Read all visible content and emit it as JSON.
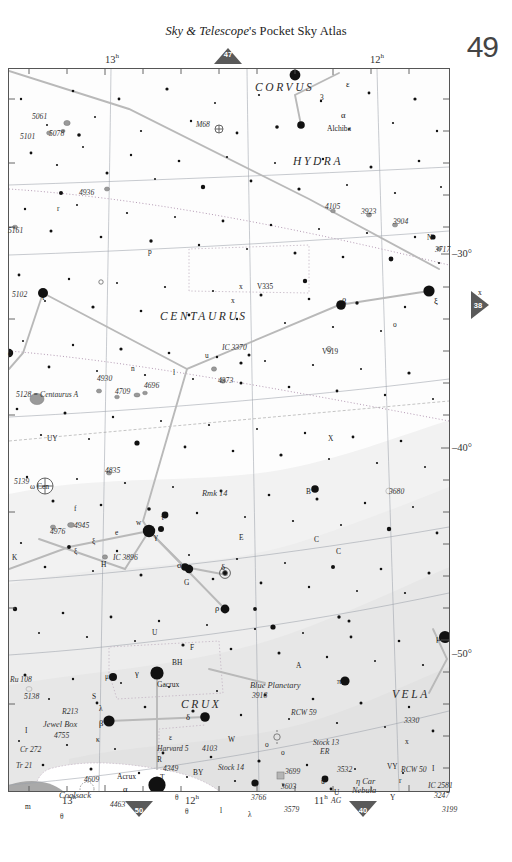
{
  "header": {
    "title_italic": "Sky & Telescope",
    "title_rest": "'s Pocket Sky Atlas",
    "page_number": "49"
  },
  "markers": {
    "top": "47",
    "right": "38",
    "bottom_left": "50",
    "bottom_right": "40"
  },
  "axes": {
    "ra_top": [
      {
        "label": "13",
        "unit": "h",
        "x": 113
      },
      {
        "label": "12",
        "unit": "h",
        "x": 378
      }
    ],
    "ra_bottom": [
      {
        "label": "13",
        "unit": "h",
        "x": 70
      },
      {
        "label": "12",
        "unit": "h",
        "x": 193
      },
      {
        "label": "11",
        "unit": "h",
        "x": 322
      }
    ],
    "dec_right": [
      {
        "label": "–30°",
        "y": 253
      },
      {
        "label": "–40°",
        "y": 447
      },
      {
        "label": "–50°",
        "y": 653
      }
    ]
  },
  "constellations": [
    {
      "name": "CORVUS",
      "x": 255,
      "y": 81
    },
    {
      "name": "HYDRA",
      "x": 293,
      "y": 155
    },
    {
      "name": "CENTAURUS",
      "x": 160,
      "y": 310
    },
    {
      "name": "CRUX",
      "x": 181,
      "y": 698
    },
    {
      "name": "VELA",
      "x": 392,
      "y": 688
    }
  ],
  "deep_sky": [
    {
      "name": "5061",
      "x": 32,
      "y": 112,
      "cls": "dso"
    },
    {
      "name": "5101",
      "x": 20,
      "y": 132,
      "cls": "dso"
    },
    {
      "name": "5078",
      "x": 49,
      "y": 129,
      "cls": "dso"
    },
    {
      "name": "M68",
      "x": 196,
      "y": 120,
      "cls": "dso"
    },
    {
      "name": "4936",
      "x": 79,
      "y": 188,
      "cls": "dso"
    },
    {
      "name": "5161",
      "x": 8,
      "y": 226,
      "cls": "dso"
    },
    {
      "name": "4105",
      "x": 325,
      "y": 202,
      "cls": "dso"
    },
    {
      "name": "3923",
      "x": 361,
      "y": 207,
      "cls": "dso"
    },
    {
      "name": "3904",
      "x": 393,
      "y": 217,
      "cls": "dso"
    },
    {
      "name": "3717",
      "x": 435,
      "y": 245,
      "cls": "dso"
    },
    {
      "name": "5102",
      "x": 12,
      "y": 290,
      "cls": "dso"
    },
    {
      "name": "IC 3370",
      "x": 222,
      "y": 343,
      "cls": "dso"
    },
    {
      "name": "4373",
      "x": 218,
      "y": 376,
      "cls": "dso"
    },
    {
      "name": "4930",
      "x": 97,
      "y": 374,
      "cls": "dso"
    },
    {
      "name": "4709",
      "x": 115,
      "y": 387,
      "cls": "dso"
    },
    {
      "name": "4696",
      "x": 144,
      "y": 381,
      "cls": "dso"
    },
    {
      "name": "5128 = Centaurus A",
      "x": 16,
      "y": 390,
      "cls": "dso"
    },
    {
      "name": "4835",
      "x": 105,
      "y": 466,
      "cls": "dso"
    },
    {
      "name": "5139",
      "x": 14,
      "y": 477,
      "cls": "dso"
    },
    {
      "name": "Rmk 14",
      "x": 202,
      "y": 489,
      "cls": "dso-big"
    },
    {
      "name": "3680",
      "x": 389,
      "y": 487,
      "cls": "dso"
    },
    {
      "name": "4976",
      "x": 50,
      "y": 527,
      "cls": "dso"
    },
    {
      "name": "4945",
      "x": 74,
      "y": 521,
      "cls": "dso"
    },
    {
      "name": "IC 3896",
      "x": 113,
      "y": 553,
      "cls": "dso"
    },
    {
      "name": "Ru 108",
      "x": 10,
      "y": 675,
      "cls": "dso"
    },
    {
      "name": "5138",
      "x": 24,
      "y": 692,
      "cls": "dso"
    },
    {
      "name": "R213",
      "x": 62,
      "y": 707,
      "cls": "dso"
    },
    {
      "name": "Jewel Box",
      "x": 43,
      "y": 720,
      "cls": "dso-big"
    },
    {
      "name": "4755",
      "x": 54,
      "y": 731,
      "cls": "dso"
    },
    {
      "name": "Cr 272",
      "x": 20,
      "y": 745,
      "cls": "dso"
    },
    {
      "name": "Tr 21",
      "x": 16,
      "y": 761,
      "cls": "dso"
    },
    {
      "name": "4609",
      "x": 84,
      "y": 775,
      "cls": "dso"
    },
    {
      "name": "4463",
      "x": 110,
      "y": 800,
      "cls": "dso"
    },
    {
      "name": "Harvard 5",
      "x": 157,
      "y": 744,
      "cls": "dso"
    },
    {
      "name": "4103",
      "x": 202,
      "y": 744,
      "cls": "dso"
    },
    {
      "name": "4349",
      "x": 163,
      "y": 764,
      "cls": "dso"
    },
    {
      "name": "Stock 14",
      "x": 218,
      "y": 763,
      "cls": "dso"
    },
    {
      "name": "3766",
      "x": 251,
      "y": 793,
      "cls": "dso"
    },
    {
      "name": "Blue Planetary",
      "x": 250,
      "y": 681,
      "cls": "dso-big"
    },
    {
      "name": "3918",
      "x": 252,
      "y": 691,
      "cls": "dso"
    },
    {
      "name": "RCW 59",
      "x": 291,
      "y": 708,
      "cls": "dso"
    },
    {
      "name": "Stock 13",
      "x": 313,
      "y": 738,
      "cls": "dso"
    },
    {
      "name": "ER",
      "x": 320,
      "y": 747,
      "cls": "dso"
    },
    {
      "name": "3532",
      "x": 337,
      "y": 765,
      "cls": "dso"
    },
    {
      "name": "3699",
      "x": 285,
      "y": 767,
      "cls": "dso"
    },
    {
      "name": "3603",
      "x": 281,
      "y": 782,
      "cls": "dso"
    },
    {
      "name": "3579",
      "x": 284,
      "y": 805,
      "cls": "dso"
    },
    {
      "name": "3330",
      "x": 404,
      "y": 716,
      "cls": "dso"
    },
    {
      "name": "RCW 50",
      "x": 401,
      "y": 765,
      "cls": "dso"
    },
    {
      "name": "IC 2581",
      "x": 428,
      "y": 781,
      "cls": "dso"
    },
    {
      "name": "3247",
      "x": 434,
      "y": 791,
      "cls": "dso"
    },
    {
      "name": "3199",
      "x": 442,
      "y": 805,
      "cls": "dso"
    },
    {
      "name": "η Car",
      "x": 356,
      "y": 777,
      "cls": "dso-big"
    },
    {
      "name": "Nebula",
      "x": 352,
      "y": 786,
      "cls": "dso-big"
    },
    {
      "name": "AG",
      "x": 331,
      "y": 796,
      "cls": "dso"
    },
    {
      "name": "Coalsack",
      "x": 59,
      "y": 790,
      "cls": "dark-neb"
    }
  ],
  "star_names": [
    {
      "name": "Alchiba",
      "x": 327,
      "y": 124
    },
    {
      "name": "ω Cen",
      "x": 30,
      "y": 482
    },
    {
      "name": "Gacrux",
      "x": 157,
      "y": 680
    },
    {
      "name": "Acrux",
      "x": 117,
      "y": 772
    }
  ],
  "bayer_labels": [
    {
      "t": "ε",
      "x": 346,
      "y": 79,
      "cls": "greek"
    },
    {
      "t": "3",
      "x": 320,
      "y": 93,
      "cls": "bayer"
    },
    {
      "t": "α",
      "x": 341,
      "y": 110,
      "cls": "greek"
    },
    {
      "t": "r",
      "x": 57,
      "y": 204,
      "cls": "bayer"
    },
    {
      "t": "p",
      "x": 148,
      "y": 247,
      "cls": "bayer"
    },
    {
      "t": "N",
      "x": 427,
      "y": 233,
      "cls": "bayer"
    },
    {
      "t": "x",
      "x": 478,
      "y": 288,
      "cls": "bayer"
    },
    {
      "t": "x",
      "x": 239,
      "y": 282,
      "cls": "bayer"
    },
    {
      "t": "x",
      "x": 231,
      "y": 296,
      "cls": "bayer"
    },
    {
      "t": "V335",
      "x": 257,
      "y": 283,
      "cls": "varname"
    },
    {
      "t": "β",
      "x": 342,
      "y": 296,
      "cls": "greek"
    },
    {
      "t": "ξ",
      "x": 434,
      "y": 296,
      "cls": "greek"
    },
    {
      "t": "ι",
      "x": 42,
      "y": 292,
      "cls": "greek"
    },
    {
      "t": "d",
      "x": 8,
      "y": 349,
      "cls": "bayer"
    },
    {
      "t": "o",
      "x": 393,
      "y": 320,
      "cls": "bayer"
    },
    {
      "t": "V919",
      "x": 322,
      "y": 348,
      "cls": "varname"
    },
    {
      "t": "u",
      "x": 205,
      "y": 351,
      "cls": "bayer"
    },
    {
      "t": "n",
      "x": 131,
      "y": 364,
      "cls": "bayer"
    },
    {
      "t": "l",
      "x": 173,
      "y": 368,
      "cls": "bayer"
    },
    {
      "t": "UY",
      "x": 47,
      "y": 434,
      "cls": "bayer"
    },
    {
      "t": "X",
      "x": 328,
      "y": 434,
      "cls": "bayer"
    },
    {
      "t": "B",
      "x": 306,
      "y": 487,
      "cls": "bayer"
    },
    {
      "t": "f",
      "x": 74,
      "y": 504,
      "cls": "bayer"
    },
    {
      "t": "w",
      "x": 136,
      "y": 518,
      "cls": "bayer"
    },
    {
      "t": "τ",
      "x": 161,
      "y": 513,
      "cls": "bayer"
    },
    {
      "t": "γ",
      "x": 154,
      "y": 531,
      "cls": "greek"
    },
    {
      "t": "e",
      "x": 115,
      "y": 528,
      "cls": "bayer"
    },
    {
      "t": "ξ",
      "x": 92,
      "y": 537,
      "cls": "bayer"
    },
    {
      "t": "ξ",
      "x": 74,
      "y": 547,
      "cls": "bayer"
    },
    {
      "t": "E",
      "x": 239,
      "y": 533,
      "cls": "bayer"
    },
    {
      "t": "C",
      "x": 314,
      "y": 535,
      "cls": "bayer"
    },
    {
      "t": "C",
      "x": 336,
      "y": 547,
      "cls": "bayer"
    },
    {
      "t": "K",
      "x": 12,
      "y": 553,
      "cls": "bayer"
    },
    {
      "t": "H",
      "x": 101,
      "y": 560,
      "cls": "bayer"
    },
    {
      "t": "σ",
      "x": 177,
      "y": 560,
      "cls": "greek"
    },
    {
      "t": "δ",
      "x": 221,
      "y": 562,
      "cls": "greek"
    },
    {
      "t": "G",
      "x": 184,
      "y": 578,
      "cls": "bayer"
    },
    {
      "t": "ρ",
      "x": 215,
      "y": 603,
      "cls": "greek"
    },
    {
      "t": "U",
      "x": 152,
      "y": 628,
      "cls": "bayer"
    },
    {
      "t": "F",
      "x": 190,
      "y": 643,
      "cls": "bayer"
    },
    {
      "t": "BH",
      "x": 172,
      "y": 658,
      "cls": "bayer"
    },
    {
      "t": "A",
      "x": 296,
      "y": 661,
      "cls": "bayer"
    },
    {
      "t": "μ",
      "x": 436,
      "y": 633,
      "cls": "greek"
    },
    {
      "t": "π",
      "x": 337,
      "y": 676,
      "cls": "greek"
    },
    {
      "t": "μ",
      "x": 105,
      "y": 672,
      "cls": "bayer"
    },
    {
      "t": "S",
      "x": 92,
      "y": 692,
      "cls": "bayer"
    },
    {
      "t": "λ",
      "x": 99,
      "y": 704,
      "cls": "bayer"
    },
    {
      "t": "β",
      "x": 99,
      "y": 718,
      "cls": "greek"
    },
    {
      "t": "δ",
      "x": 186,
      "y": 712,
      "cls": "greek"
    },
    {
      "t": "γ",
      "x": 135,
      "y": 668,
      "cls": "greek"
    },
    {
      "t": "κ",
      "x": 96,
      "y": 735,
      "cls": "bayer"
    },
    {
      "t": "I",
      "x": 25,
      "y": 726,
      "cls": "bayer"
    },
    {
      "t": "ε",
      "x": 169,
      "y": 733,
      "cls": "bayer"
    },
    {
      "t": "R",
      "x": 157,
      "y": 755,
      "cls": "bayer"
    },
    {
      "t": "T",
      "x": 160,
      "y": 773,
      "cls": "bayer"
    },
    {
      "t": "BY",
      "x": 193,
      "y": 768,
      "cls": "bayer"
    },
    {
      "t": "W",
      "x": 228,
      "y": 735,
      "cls": "bayer"
    },
    {
      "t": "α",
      "x": 123,
      "y": 784,
      "cls": "greek"
    },
    {
      "t": "θ",
      "x": 175,
      "y": 793,
      "cls": "bayer"
    },
    {
      "t": "θ",
      "x": 185,
      "y": 807,
      "cls": "bayer"
    },
    {
      "t": "θ",
      "x": 60,
      "y": 812,
      "cls": "bayer"
    },
    {
      "t": "m",
      "x": 25,
      "y": 802,
      "cls": "bayer"
    },
    {
      "t": "λ",
      "x": 248,
      "y": 810,
      "cls": "bayer"
    },
    {
      "t": "o",
      "x": 265,
      "y": 740,
      "cls": "bayer"
    },
    {
      "t": "o",
      "x": 281,
      "y": 748,
      "cls": "bayer"
    },
    {
      "t": "u",
      "x": 321,
      "y": 777,
      "cls": "bayer"
    },
    {
      "t": "U",
      "x": 334,
      "y": 788,
      "cls": "bayer"
    },
    {
      "t": "VY",
      "x": 387,
      "y": 762,
      "cls": "bayer"
    },
    {
      "t": "r",
      "x": 399,
      "y": 776,
      "cls": "bayer"
    },
    {
      "t": "Y",
      "x": 390,
      "y": 793,
      "cls": "bayer"
    },
    {
      "t": "x",
      "x": 405,
      "y": 737,
      "cls": "bayer"
    },
    {
      "t": "I",
      "x": 432,
      "y": 764,
      "cls": "bayer"
    },
    {
      "t": "l",
      "x": 220,
      "y": 806,
      "cls": "bayer"
    }
  ],
  "colors": {
    "ink": "#1a1a1a",
    "frame": "#555555",
    "grid": "#9aa0a8",
    "ecliptic": "#b08fb0",
    "milkyway": "#efefef",
    "nebula_gray": "#a8a8a8",
    "marker_fill": "#5a5a5a"
  },
  "chart_data": {
    "type": "scatter",
    "xlabel": "Right Ascension",
    "ylabel": "Declination",
    "xlim": [
      "13h 30m",
      "10h 30m"
    ],
    "ylim": [
      -57,
      -25
    ],
    "grid": true,
    "legend": "none"
  }
}
